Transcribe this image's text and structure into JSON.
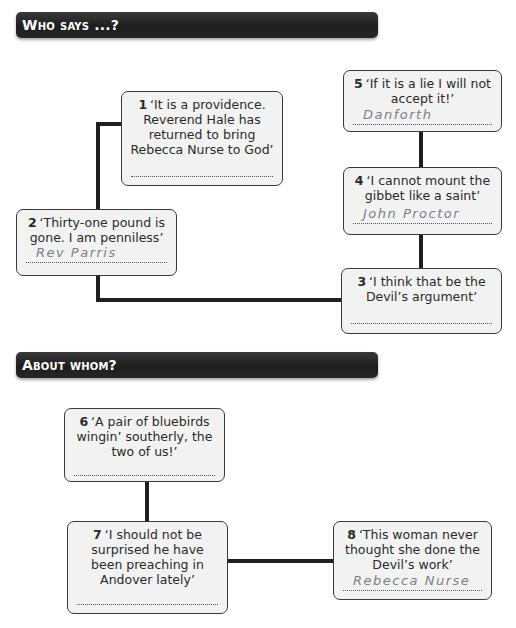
{
  "sections": [
    {
      "title": "Who says ...?",
      "boxes": [
        {
          "num": "1",
          "quote": "‘It is a providence. Reverend Hale has returned to bring Rebecca Nurse to God’",
          "answer": ""
        },
        {
          "num": "2",
          "quote": "‘Thirty-one pound is gone. I am penniless’",
          "answer": "Rev Parris"
        },
        {
          "num": "3",
          "quote": "‘I think that be the Devil’s argument’",
          "answer": ""
        },
        {
          "num": "4",
          "quote": "‘I cannot mount the gibbet like a saint’",
          "answer": "John Proctor"
        },
        {
          "num": "5",
          "quote": "‘If it is a lie I will not accept it!’",
          "answer": "Danforth"
        }
      ]
    },
    {
      "title": "About whom?",
      "boxes": [
        {
          "num": "6",
          "quote": "‘A pair of bluebirds wingin’ southerly, the two of us!’",
          "answer": ""
        },
        {
          "num": "7",
          "quote": "‘I should not be surprised he have been preaching in Andover lately’",
          "answer": ""
        },
        {
          "num": "8",
          "quote": "‘This woman never thought she done the Devil’s work’",
          "answer": "Rebecca Nurse"
        }
      ]
    }
  ],
  "colors": {
    "header_bg": "#262626",
    "box_bg": "#f2f2f2",
    "connector": "#1f1f1f",
    "handwriting": "#7a7f8a"
  }
}
